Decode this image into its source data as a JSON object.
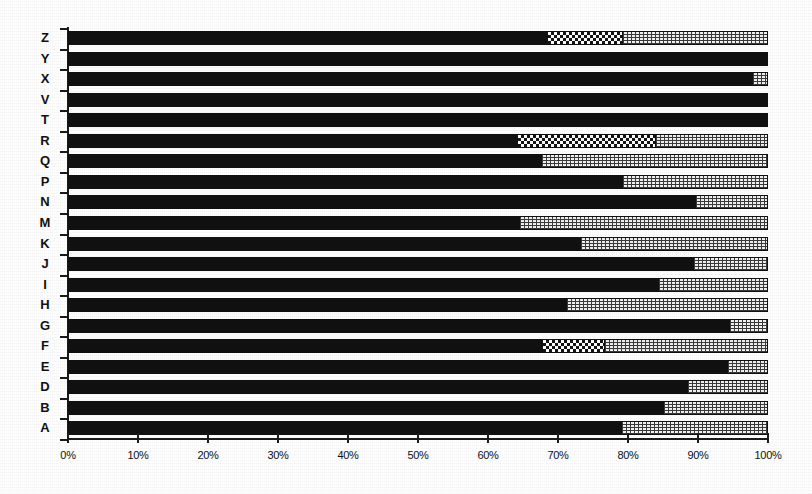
{
  "chart_data": {
    "type": "bar",
    "orientation": "horizontal",
    "stacked": true,
    "normalized_percent": true,
    "title": "",
    "subtitle": "",
    "xlabel": "",
    "ylabel": "",
    "xlim": [
      0,
      100
    ],
    "grid": false,
    "legend_position": "none",
    "x_tick_labels": [
      "0%",
      "10%",
      "20%",
      "30%",
      "40%",
      "50%",
      "60%",
      "70%",
      "80%",
      "90%",
      "100%"
    ],
    "x_tick_values": [
      0,
      10,
      20,
      30,
      40,
      50,
      60,
      70,
      80,
      90,
      100
    ],
    "categories": [
      "Z",
      "Y",
      "X",
      "V",
      "T",
      "R",
      "Q",
      "P",
      "N",
      "M",
      "K",
      "J",
      "I",
      "H",
      "G",
      "F",
      "E",
      "D",
      "B",
      "A"
    ],
    "series": [
      {
        "name": "series-1-solid",
        "fill": "solid-black",
        "color": "#111111",
        "values": [
          68.5,
          100.0,
          97.7,
          100.0,
          100.0,
          64.3,
          67.6,
          79.1,
          89.6,
          64.4,
          73.1,
          89.3,
          84.3,
          71.1,
          94.4,
          67.9,
          94.1,
          88.4,
          85.0,
          79.0
        ]
      },
      {
        "name": "series-2-checker",
        "fill": "dark-checkerboard",
        "color": "#141414",
        "values": [
          10.6,
          0.0,
          0.0,
          0.0,
          0.0,
          19.6,
          0.0,
          0.0,
          0.0,
          0.0,
          0.0,
          0.0,
          0.0,
          0.0,
          0.0,
          8.7,
          0.0,
          0.0,
          0.0,
          0.0
        ]
      },
      {
        "name": "series-3-stipple",
        "fill": "light-stipple",
        "color": "#f2f2f2",
        "values": [
          20.9,
          0.0,
          2.3,
          0.0,
          0.0,
          16.1,
          32.4,
          20.9,
          10.4,
          35.6,
          26.9,
          10.7,
          15.7,
          28.9,
          5.6,
          23.4,
          5.9,
          11.6,
          15.0,
          21.0
        ]
      }
    ]
  }
}
